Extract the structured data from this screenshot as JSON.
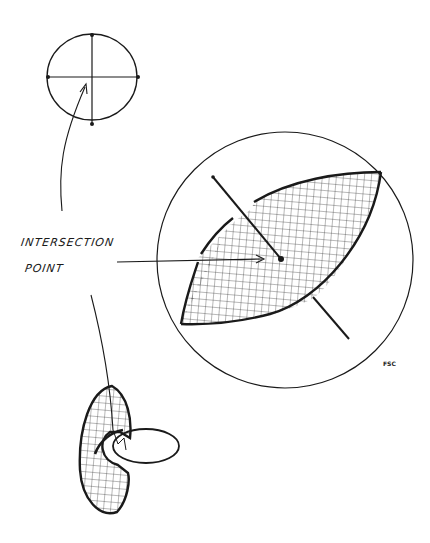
{
  "diagram": {
    "type": "hand-drawn illustration",
    "labels": {
      "line1": "INTERSECTION",
      "line2": "POINT"
    },
    "signature": "FSC",
    "figures": [
      {
        "id": "small-circle",
        "description": "Circle with cross (perpendicular diameters) and four dots where the lines meet the circle"
      },
      {
        "id": "large-circle",
        "description": "Large circle containing a hatched lens (vesica) shape with a perpendicular line passing through an intersection point dot"
      },
      {
        "id": "linked-rings",
        "description": "Two interlocking rings: a hatched vertical ring and a horizontal ellipse ring"
      }
    ],
    "arrows": [
      {
        "from": "label",
        "to": "small-circle center"
      },
      {
        "from": "label",
        "to": "large-circle intersection point"
      },
      {
        "from": "label",
        "to": "linked-rings link point"
      }
    ],
    "colors": {
      "ink": "#1a1a1a",
      "background": "#ffffff"
    }
  }
}
